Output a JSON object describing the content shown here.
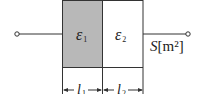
{
  "diagram": {
    "type": "parallel-plate capacitor with two dielectrics in series",
    "dielectrics": [
      {
        "symbol": "ε",
        "subscript": "1",
        "fill": "#b8b8b8"
      },
      {
        "symbol": "ε",
        "subscript": "2",
        "fill": "#ffffff"
      }
    ],
    "area_label": {
      "symbol": "S",
      "unit": "[m²]"
    },
    "dimensions": [
      {
        "symbol": "l",
        "subscript": "1"
      },
      {
        "symbol": "l",
        "subscript": "2"
      }
    ],
    "colors": {
      "line": "#333333",
      "shade": "#b8b8b8"
    }
  }
}
